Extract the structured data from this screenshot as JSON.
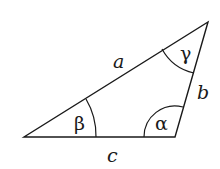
{
  "diagram": {
    "vertices": {
      "left": [
        24,
        137
      ],
      "right": [
        175,
        137
      ],
      "top": [
        208,
        22
      ]
    },
    "sides": {
      "a": "a",
      "b": "b",
      "c": "c"
    },
    "angles": {
      "alpha": "α",
      "beta": "β",
      "gamma": "γ"
    },
    "stroke_color": "#1a1a1a",
    "background": "#ffffff"
  }
}
